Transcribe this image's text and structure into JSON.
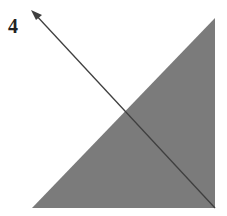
{
  "figure": {
    "label": "4",
    "shape": "right-triangle",
    "fill_color": "#7a7a7a",
    "arrow_color": "#444444",
    "arrow_direction": "up-left"
  }
}
